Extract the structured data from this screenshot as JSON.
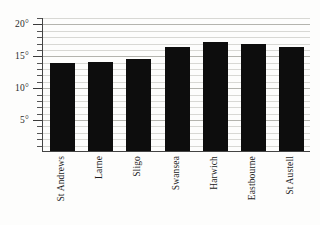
{
  "chart_data": {
    "type": "bar",
    "title": "",
    "subtitle": "",
    "xlabel": "",
    "ylabel": "",
    "categories": [
      "St Andrews",
      "Larne",
      "Sligo",
      "Swansea",
      "Harwich",
      "Eastbourne",
      "St Austell"
    ],
    "values": [
      13.8,
      14.0,
      14.4,
      16.3,
      17.1,
      16.7,
      16.3
    ],
    "unit": "°",
    "ylim": [
      0,
      21
    ],
    "ytick_labels": [
      "20°",
      "15°",
      "10°",
      "5°"
    ],
    "ytick_values": [
      20,
      15,
      10,
      5
    ],
    "ytick_minor_step": 1,
    "grid": true,
    "grid_orientation": "horizontal",
    "legend": "none",
    "bar_color": "#0d0d0d",
    "gridline_color": "#d8d8d4",
    "axis_color": "#444444",
    "background_color": "#fdfdfc"
  }
}
